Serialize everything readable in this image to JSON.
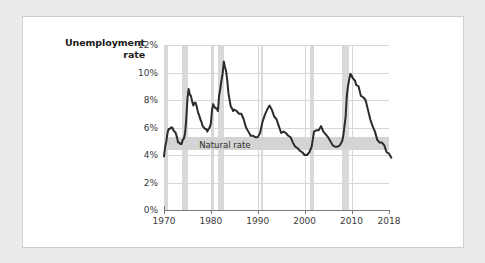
{
  "card": {
    "background": "#ffffff",
    "border_color": "#cfcfcf"
  },
  "axis_title": {
    "line1": "Unemployment",
    "line2": "rate"
  },
  "annotation": {
    "natural_rate_label": "Natural rate"
  },
  "colors": {
    "series_line": "#2b2b2b",
    "recession_band": "#d9d9d9",
    "natural_band": "#d4d4d4",
    "gridline": "#d7d7d7",
    "axis": "#7a7a7a",
    "page_background": "#ebebeb"
  },
  "chart_data": {
    "type": "line",
    "title": "",
    "subtitle": "",
    "xlabel": "",
    "ylabel": "Unemployment rate",
    "xlim": [
      1970,
      2018
    ],
    "ylim": [
      0,
      12
    ],
    "grid": true,
    "legend": "none",
    "ytick_labels": [
      "0%",
      "2%",
      "4%",
      "6%",
      "8%",
      "10%",
      "12%"
    ],
    "yticks": [
      0,
      2,
      4,
      6,
      8,
      10,
      12
    ],
    "xtick_labels": [
      "1970",
      "1980",
      "1990",
      "2000",
      "2010",
      "2018"
    ],
    "xticks": [
      1970,
      1980,
      1990,
      2000,
      2010,
      2018
    ],
    "annotations": [
      {
        "text": "Natural rate",
        "type": "band",
        "y_low": 4.4,
        "y_high": 5.3,
        "x_start": 1970,
        "x_end": 2018
      }
    ],
    "shaded_regions": [
      {
        "label": "recession",
        "x_start": 1970.0,
        "x_end": 1970.9
      },
      {
        "label": "recession",
        "x_start": 1973.9,
        "x_end": 1975.2
      },
      {
        "label": "recession",
        "x_start": 1980.1,
        "x_end": 1980.6
      },
      {
        "label": "recession",
        "x_start": 1981.6,
        "x_end": 1982.9
      },
      {
        "label": "recession",
        "x_start": 1990.6,
        "x_end": 1991.2
      },
      {
        "label": "recession",
        "x_start": 2001.2,
        "x_end": 2001.9
      },
      {
        "label": "recession",
        "x_start": 2007.9,
        "x_end": 2009.5
      }
    ],
    "series": [
      {
        "name": "Unemployment rate",
        "color": "#2b2b2b",
        "x": [
          1970.0,
          1970.25,
          1970.5,
          1970.75,
          1971.0,
          1971.25,
          1971.5,
          1971.75,
          1972.0,
          1972.25,
          1972.5,
          1972.75,
          1973.0,
          1973.25,
          1973.5,
          1973.75,
          1974.0,
          1974.25,
          1974.5,
          1974.75,
          1975.0,
          1975.25,
          1975.5,
          1975.75,
          1976.0,
          1976.25,
          1976.5,
          1976.75,
          1977.0,
          1977.25,
          1977.5,
          1977.75,
          1978.0,
          1978.25,
          1978.5,
          1978.75,
          1979.0,
          1979.25,
          1979.5,
          1979.75,
          1980.0,
          1980.25,
          1980.5,
          1980.75,
          1981.0,
          1981.25,
          1981.5,
          1981.75,
          1982.0,
          1982.25,
          1982.5,
          1982.75,
          1983.0,
          1983.25,
          1983.5,
          1983.75,
          1984.0,
          1984.25,
          1984.5,
          1984.75,
          1985.0,
          1985.5,
          1986.0,
          1986.5,
          1987.0,
          1987.5,
          1988.0,
          1988.5,
          1989.0,
          1989.5,
          1990.0,
          1990.5,
          1991.0,
          1991.5,
          1992.0,
          1992.5,
          1993.0,
          1993.5,
          1994.0,
          1994.5,
          1995.0,
          1995.5,
          1996.0,
          1996.5,
          1997.0,
          1997.5,
          1998.0,
          1998.5,
          1999.0,
          1999.5,
          2000.0,
          2000.5,
          2001.0,
          2001.5,
          2002.0,
          2002.5,
          2003.0,
          2003.5,
          2004.0,
          2004.5,
          2005.0,
          2005.5,
          2006.0,
          2006.5,
          2007.0,
          2007.5,
          2008.0,
          2008.25,
          2008.5,
          2008.75,
          2009.0,
          2009.25,
          2009.5,
          2009.75,
          2010.0,
          2010.25,
          2010.5,
          2010.75,
          2011.0,
          2011.5,
          2012.0,
          2012.5,
          2013.0,
          2013.5,
          2014.0,
          2014.5,
          2015.0,
          2015.5,
          2016.0,
          2016.5,
          2017.0,
          2017.5,
          2018.0,
          2018.5
        ],
        "y": [
          3.9,
          4.6,
          5.0,
          5.6,
          5.9,
          5.9,
          6.0,
          6.0,
          5.8,
          5.7,
          5.6,
          5.3,
          4.9,
          4.9,
          4.8,
          4.8,
          5.1,
          5.2,
          5.6,
          6.6,
          8.1,
          8.8,
          8.4,
          8.3,
          7.9,
          7.6,
          7.8,
          7.8,
          7.5,
          7.1,
          6.9,
          6.6,
          6.4,
          6.1,
          6.0,
          5.9,
          5.9,
          5.7,
          5.9,
          6.0,
          6.3,
          7.3,
          7.7,
          7.5,
          7.4,
          7.4,
          7.2,
          8.3,
          8.8,
          9.4,
          9.9,
          10.8,
          10.4,
          10.1,
          9.4,
          8.5,
          8.0,
          7.5,
          7.4,
          7.2,
          7.3,
          7.2,
          7.0,
          7.0,
          6.6,
          6.0,
          5.7,
          5.4,
          5.4,
          5.3,
          5.3,
          5.6,
          6.4,
          6.9,
          7.3,
          7.6,
          7.3,
          6.8,
          6.6,
          6.1,
          5.6,
          5.7,
          5.6,
          5.4,
          5.3,
          4.9,
          4.6,
          4.5,
          4.3,
          4.2,
          4.0,
          4.0,
          4.2,
          4.6,
          5.7,
          5.8,
          5.8,
          6.1,
          5.7,
          5.5,
          5.3,
          5.0,
          4.7,
          4.6,
          4.6,
          4.7,
          5.0,
          5.4,
          6.1,
          6.8,
          8.3,
          9.0,
          9.5,
          9.9,
          9.8,
          9.6,
          9.5,
          9.4,
          9.1,
          9.0,
          8.3,
          8.2,
          8.0,
          7.3,
          6.6,
          6.1,
          5.7,
          5.1,
          4.9,
          4.9,
          4.7,
          4.2,
          4.1,
          3.8
        ]
      }
    ]
  }
}
